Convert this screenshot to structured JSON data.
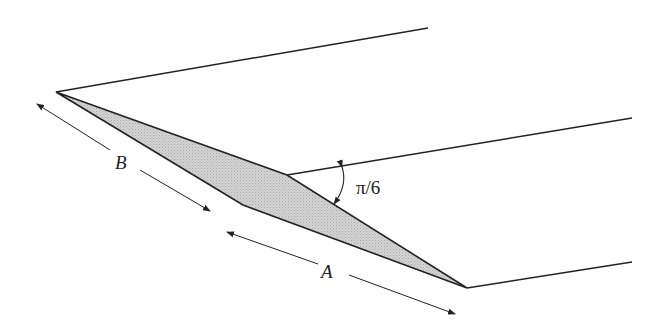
{
  "diagram": {
    "labels": {
      "a": "A",
      "b": "B",
      "angle": "π/6"
    },
    "colors": {
      "stroke": "#222222",
      "fill": "#c9c9c9",
      "background": "#ffffff"
    },
    "shape": {
      "shaded_quadrilateral": [
        [
          56,
          92
        ],
        [
          287,
          175
        ],
        [
          467,
          288
        ],
        [
          243,
          205
        ]
      ]
    },
    "edges": [
      {
        "from": [
          56,
          92
        ],
        "to": [
          428,
          28
        ]
      },
      {
        "from": [
          287,
          175
        ],
        "to": [
          632,
          118
        ]
      },
      {
        "from": [
          467,
          288
        ],
        "to": [
          632,
          262
        ]
      }
    ]
  }
}
